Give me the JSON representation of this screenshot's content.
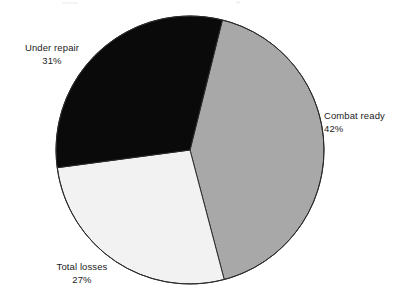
{
  "chart_data": {
    "type": "pie",
    "title": "",
    "subtitle": "",
    "xlabel": "",
    "ylabel": "",
    "legend_position": "none",
    "grid": false,
    "labels_outside": true,
    "total_percent": 100,
    "categories": [
      "Combat ready",
      "Total losses",
      "Under repair"
    ],
    "values": [
      42,
      27,
      31
    ],
    "value_suffix": "%",
    "slices": [
      {
        "label": "Combat ready",
        "value": 42,
        "value_text": "42%",
        "color": "#a8a8a8",
        "start_angle_deg": 14,
        "end_angle_deg": 165.2,
        "label_position": "right"
      },
      {
        "label": "Total losses",
        "value": 27,
        "value_text": "27%",
        "color": "#f2f2f2",
        "start_angle_deg": 165.2,
        "end_angle_deg": 262.4,
        "label_position": "bottom-left"
      },
      {
        "label": "Under repair",
        "value": 31,
        "value_text": "31%",
        "color": "#0a0a0a",
        "start_angle_deg": 262.4,
        "end_angle_deg": 374,
        "label_position": "top-left"
      }
    ],
    "geometry": {
      "center_x": 190,
      "center_y": 150,
      "radius": 134,
      "start_offset_deg": 14
    },
    "style": {
      "background": "#ffffff",
      "outline_color": "#2b2b2b",
      "outline_width": 1,
      "text_color": "#1c1c1c"
    }
  },
  "labels": {
    "under_repair": {
      "name": "Under repair",
      "percent": "31%"
    },
    "combat_ready": {
      "name": "Combat ready",
      "percent": "42%"
    },
    "total_losses": {
      "name": "Total losses",
      "percent": "27%"
    }
  }
}
